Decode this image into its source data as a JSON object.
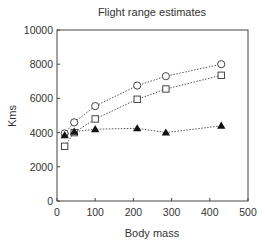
{
  "chart_data": {
    "type": "line",
    "title": "Flight range estimates",
    "xlabel": "Body mass",
    "ylabel": "Kms",
    "xlim": [
      0,
      500
    ],
    "ylim": [
      0,
      10000
    ],
    "xticks": [
      0,
      100,
      200,
      300,
      400,
      500
    ],
    "yticks": [
      0,
      2000,
      4000,
      6000,
      8000,
      10000
    ],
    "grid": false,
    "legend": null,
    "x": [
      20,
      45,
      100,
      210,
      285,
      430
    ],
    "series": [
      {
        "name": "open-circle",
        "marker": "circle-open",
        "linestyle": "dotted",
        "values": [
          3950,
          4600,
          5550,
          6750,
          7300,
          8000
        ]
      },
      {
        "name": "open-square",
        "marker": "square-open",
        "linestyle": "dotted",
        "values": [
          3200,
          4000,
          4800,
          5950,
          6550,
          7350
        ]
      },
      {
        "name": "filled-triangle",
        "marker": "triangle-filled",
        "linestyle": "dotted",
        "values": [
          3850,
          4050,
          4200,
          4250,
          4000,
          4400
        ]
      }
    ]
  }
}
